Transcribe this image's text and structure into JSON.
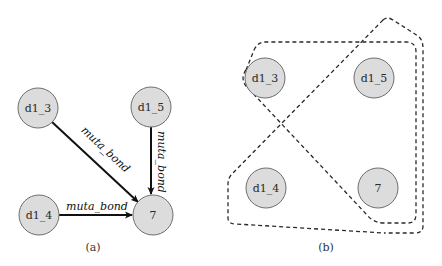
{
  "panel_a": {
    "caption": "(a)",
    "nodes": {
      "d1_3": "d1_3",
      "d1_5": "d1_5",
      "d1_4": "d1_4",
      "n7": "7"
    },
    "edges": [
      {
        "from": "d1_3",
        "to": "7",
        "label": "muta_bond"
      },
      {
        "from": "d1_5",
        "to": "7",
        "label": "muta_bond"
      },
      {
        "from": "d1_4",
        "to": "7",
        "label": "muta_bond"
      }
    ]
  },
  "panel_b": {
    "caption": "(b)",
    "nodes": {
      "d1_3": "d1_3",
      "d1_5": "d1_5",
      "d1_4": "d1_4",
      "n7": "7"
    },
    "hyperedges": [
      {
        "members": [
          "d1_3",
          "7"
        ],
        "style": "dashed"
      },
      {
        "members": [
          "d1_5",
          "7"
        ],
        "style": "dashed"
      },
      {
        "members": [
          "d1_4",
          "7"
        ],
        "style": "dashed"
      }
    ]
  },
  "colors": {
    "node_fill": "#dcdcdc",
    "node_stroke": "#6e6e6e",
    "edge": "#111111",
    "hyperedge": "#2a2a2a"
  }
}
